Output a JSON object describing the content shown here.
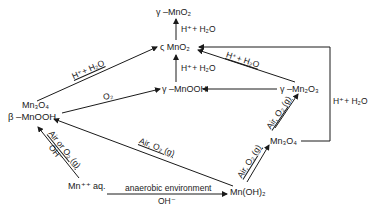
{
  "diagram": {
    "type": "reaction-scheme",
    "nodes": {
      "gamma_mno2": "γ –MnO₂",
      "sigma_mno2": "ς MnO₂",
      "gamma_mnooh": "γ –MnOOH",
      "mn3o4_left": "Mn₃O₄",
      "beta_mnooh": "β  –MnOOH",
      "gamma_mn2o3": "γ –Mn₂O₃",
      "mn3o4_right": "Mn₃O₄",
      "mn_aq": "Mn⁺⁺ aq.",
      "mn_oh2": "Mn(OH)₂"
    },
    "conditions": {
      "h_h2o_top": "H⁺+ H₂O",
      "h_h2o_middle": "H⁺+ H₂O",
      "h_h2o_diag_left": "H⁺+ H₂O",
      "h_h2o_diag_right": "H⁺+ H₂O",
      "h_h2o_box": "H⁺+ H₂O",
      "o2": "O₂",
      "air_or_o2": "Air or O₂ (g)",
      "oh_left": "OH⁻",
      "air_o2_long": "Air, O₂ (g)",
      "air_o2_right_lower": "Air, O₂ (g)",
      "air_o2_right_upper": "Air, O₂ (g)",
      "anaerobic": "anaerobic  environment",
      "oh_bottom": "OH⁻"
    },
    "edges": [
      {
        "from": "sigma_mno2",
        "to": "gamma_mno2",
        "label": "H⁺+ H₂O"
      },
      {
        "from": "gamma_mnooh",
        "to": "sigma_mno2",
        "label": "H⁺+ H₂O"
      },
      {
        "from": "mn3o4_left",
        "to": "sigma_mno2",
        "label": "H⁺+ H₂O"
      },
      {
        "from": "beta_mnooh",
        "to": "gamma_mnooh",
        "label": "O₂"
      },
      {
        "from": "gamma_mn2o3",
        "to": "sigma_mno2",
        "label": "H⁺+ H₂O"
      },
      {
        "from": "gamma_mn2o3",
        "to": "gamma_mnooh",
        "label": ""
      },
      {
        "from": "mn3o4_right",
        "to": "sigma_mno2",
        "label": "H⁺+ H₂O"
      },
      {
        "from": "mn_aq",
        "to": "beta_mnooh",
        "label": "Air or O₂ (g), OH⁻"
      },
      {
        "from": "mn_oh2",
        "to": "beta_mnooh",
        "label": "Air, O₂ (g)"
      },
      {
        "from": "mn_oh2",
        "to": "mn3o4_right",
        "label": "Air, O₂ (g)"
      },
      {
        "from": "mn3o4_right",
        "to": "gamma_mn2o3",
        "label": "Air, O₂ (g)"
      },
      {
        "from": "mn_aq",
        "to": "mn_oh2",
        "label": "anaerobic environment, OH⁻"
      }
    ],
    "colors": {
      "ink": "#1a1a1a",
      "background": "#ffffff"
    }
  }
}
